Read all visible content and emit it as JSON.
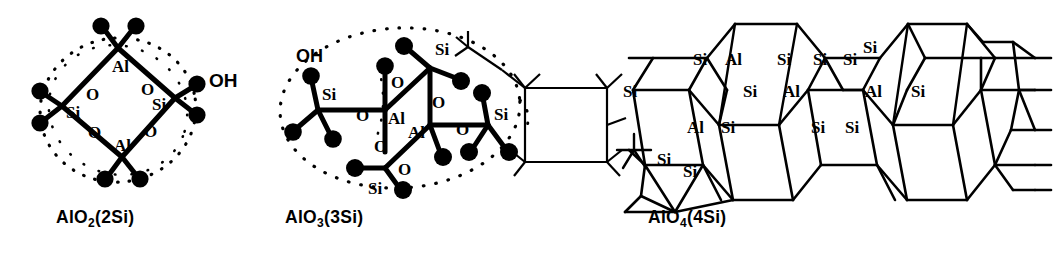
{
  "figure": {
    "background_color": "#ffffff",
    "ink_color": "#000000",
    "style": "scanned ball-and-stick chemical structure line art",
    "panel_count": 3
  },
  "panels": [
    {
      "id": "alo2-2si",
      "caption_formula": "AlO",
      "caption_subscript": "2",
      "caption_suffix": "(2Si)",
      "caption_full": "AlO2(2Si)",
      "description": "four-membered Al-O-Si-O ring drawn as a rhombus enclosed by a dotted ellipse",
      "ring_atoms": [
        "Al",
        "O",
        "Si",
        "O",
        "Al",
        "O",
        "Si",
        "O"
      ],
      "vertex_labels": {
        "top": "Al",
        "left": "Si",
        "right": "Si",
        "bottom": "Al"
      },
      "edge_labels": [
        "O",
        "O",
        "O",
        "O"
      ],
      "terminal_label": "OH",
      "has_dotted_outline": true,
      "terminal_ball_count": 8
    },
    {
      "id": "alo3-3si",
      "caption_formula": "AlO",
      "caption_subscript": "3",
      "caption_suffix": "(3Si)",
      "caption_full": "AlO3(3Si)",
      "description": "two linked Al centres each bridged through O to terminal Si(OH) groups, enclosed by a dotted outline, with an open-line framework cage drawn at the right",
      "center_labels": [
        "Al",
        "Al"
      ],
      "si_labels": [
        "Si",
        "Si",
        "Si",
        "Si"
      ],
      "bridge_labels": [
        "O",
        "O",
        "O",
        "O",
        "O"
      ],
      "terminal_label": "OH",
      "has_dotted_outline": true,
      "has_wireframe_cage": true
    },
    {
      "id": "alo4-4si",
      "caption_formula": "AlO",
      "caption_subscript": "4",
      "caption_suffix": "(4Si)",
      "caption_full": "AlO4(4Si)",
      "description": "extended three-dimensional aluminosilicate framework of fused six-rings drawn in open line style with Si and Al site labels",
      "site_labels": [
        "Si",
        "Al",
        "Si",
        "Si",
        "Si",
        "Si",
        "Si",
        "Si",
        "Al",
        "Si",
        "Al",
        "Si",
        "Al",
        "Si",
        "Si",
        "Si",
        "Si",
        "Si"
      ],
      "has_dotted_outline": false,
      "has_wireframe_cage": true
    }
  ],
  "labels": {
    "aluminium": "Al",
    "silicon": "Si",
    "oxygen": "O",
    "hydroxyl": "OH"
  }
}
